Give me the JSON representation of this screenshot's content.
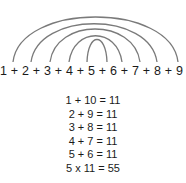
{
  "diagram": {
    "sequence": "1 + 2 + 3 + 4 + 5 + 6 + 7 + 8 + 9 + 10",
    "arc_color": "#7a7a7a",
    "arcs": [
      {
        "pair": "1-10"
      },
      {
        "pair": "2-9"
      },
      {
        "pair": "3-8"
      },
      {
        "pair": "4-7"
      },
      {
        "pair": "5-6"
      }
    ],
    "equations": [
      "1 + 10 = 11",
      "2 + 9 = 11",
      "3 + 8 = 11",
      "4 + 7 = 11",
      "5 + 6 = 11",
      "5 x 11 = 55"
    ]
  }
}
